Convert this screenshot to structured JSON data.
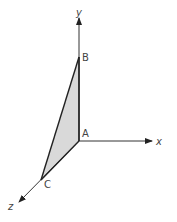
{
  "diagram": {
    "axes": {
      "y_label": "y",
      "x_label": "x",
      "z_label": "z"
    },
    "points": {
      "A": "A",
      "B": "B",
      "C": "C"
    },
    "colors": {
      "fill": "#d9d9d9",
      "stroke": "#222222",
      "axis": "#333333"
    }
  }
}
